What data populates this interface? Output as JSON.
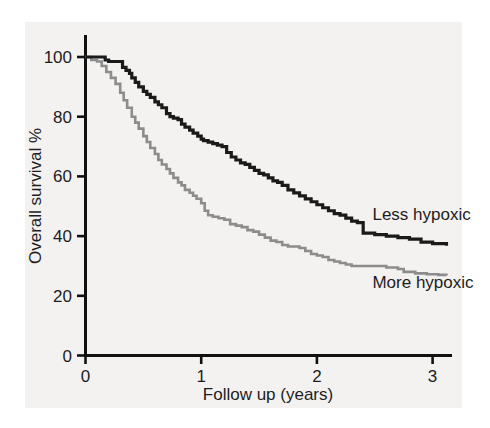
{
  "chart_data": {
    "type": "line",
    "subtype": "kaplan-meier-survival",
    "title": "",
    "xlabel": "Follow up (years)",
    "ylabel": "Overall survival %",
    "xlim": [
      0,
      3.15
    ],
    "ylim": [
      0,
      108
    ],
    "grid": false,
    "legend_position": "inline-right",
    "xticks": [
      "0",
      "1",
      "2",
      "3"
    ],
    "xtick_values": [
      0,
      1,
      2,
      3
    ],
    "yticks": [
      "0",
      "20",
      "40",
      "60",
      "80",
      "100"
    ],
    "ytick_values": [
      0,
      20,
      40,
      60,
      80,
      100
    ],
    "series": [
      {
        "name": "Less hypoxic",
        "color": "#1a1a1a",
        "label_x": 2.48,
        "label_y": 45.5,
        "x": [
          0,
          0.06,
          0.12,
          0.17,
          0.2,
          0.25,
          0.28,
          0.32,
          0.35,
          0.38,
          0.4,
          0.43,
          0.46,
          0.5,
          0.53,
          0.56,
          0.6,
          0.63,
          0.66,
          0.7,
          0.73,
          0.76,
          0.8,
          0.83,
          0.86,
          0.9,
          0.93,
          0.97,
          1.0,
          1.02,
          1.06,
          1.1,
          1.14,
          1.18,
          1.22,
          1.26,
          1.3,
          1.34,
          1.38,
          1.42,
          1.46,
          1.5,
          1.54,
          1.58,
          1.62,
          1.66,
          1.7,
          1.75,
          1.8,
          1.85,
          1.9,
          1.95,
          2.0,
          2.05,
          2.1,
          2.15,
          2.2,
          2.25,
          2.3,
          2.35,
          2.4,
          2.5,
          2.6,
          2.7,
          2.8,
          2.9,
          3.0,
          3.12
        ],
        "y": [
          100,
          100,
          100,
          99,
          98.5,
          98.5,
          98.5,
          96.5,
          95.5,
          94.5,
          93,
          91.5,
          90,
          88.5,
          87.5,
          86.5,
          85,
          84,
          83,
          81,
          80,
          79.5,
          79,
          77.5,
          76.5,
          75.5,
          74.5,
          73.5,
          72.5,
          72,
          71.5,
          71,
          70.5,
          70,
          68,
          66.5,
          65.5,
          64.5,
          64,
          63,
          62,
          61,
          60.5,
          59.5,
          58.5,
          58,
          57,
          55.5,
          54.5,
          53.5,
          52.5,
          51.5,
          50.5,
          49.5,
          48.5,
          47.5,
          47,
          46,
          45,
          44.5,
          41,
          40.5,
          40,
          39.5,
          39,
          38,
          37.5,
          36.8
        ]
      },
      {
        "name": "More hypoxic",
        "color": "#8c8c8c",
        "label_x": 2.48,
        "label_y": 22.5,
        "x": [
          0,
          0.05,
          0.1,
          0.14,
          0.18,
          0.22,
          0.26,
          0.3,
          0.33,
          0.36,
          0.4,
          0.43,
          0.46,
          0.5,
          0.53,
          0.56,
          0.6,
          0.63,
          0.66,
          0.7,
          0.73,
          0.76,
          0.8,
          0.83,
          0.86,
          0.9,
          0.93,
          0.96,
          1.0,
          1.03,
          1.06,
          1.1,
          1.15,
          1.2,
          1.25,
          1.3,
          1.35,
          1.4,
          1.45,
          1.5,
          1.55,
          1.6,
          1.65,
          1.7,
          1.75,
          1.8,
          1.85,
          1.9,
          1.95,
          2.0,
          2.05,
          2.1,
          2.15,
          2.2,
          2.25,
          2.3,
          2.4,
          2.5,
          2.6,
          2.7,
          2.75,
          2.85,
          2.95,
          3.05,
          3.12
        ],
        "y": [
          100,
          99,
          98.5,
          97,
          95,
          93,
          91,
          88,
          85.5,
          83,
          80,
          78,
          76,
          73.5,
          71.5,
          69.5,
          67.5,
          65.5,
          64,
          62.5,
          61,
          59.5,
          58,
          57,
          55.5,
          54.5,
          53.5,
          52.5,
          51,
          48.5,
          47,
          46.5,
          46,
          45.5,
          44,
          43.5,
          43,
          42,
          41.5,
          40.5,
          39.5,
          38.5,
          38,
          37,
          36.5,
          36.5,
          36,
          35,
          34,
          33.5,
          33,
          32,
          31.5,
          31,
          30.5,
          30,
          30,
          30,
          29.5,
          29,
          28,
          27.5,
          27.2,
          27,
          26.8
        ]
      }
    ]
  },
  "axes": {
    "xlabel": "Follow up (years)",
    "ylabel": "Overall survival %",
    "xticks": [
      "0",
      "1",
      "2",
      "3"
    ],
    "yticks": [
      "0",
      "20",
      "40",
      "60",
      "80",
      "100"
    ]
  },
  "labels": {
    "series_less": "Less hypoxic",
    "series_more": "More hypoxic"
  },
  "colors": {
    "less_hypoxic": "#1a1a1a",
    "more_hypoxic": "#8c8c8c",
    "panel_background": "#f3f2f0",
    "axis": "#111111",
    "text": "#1d1d1d"
  }
}
